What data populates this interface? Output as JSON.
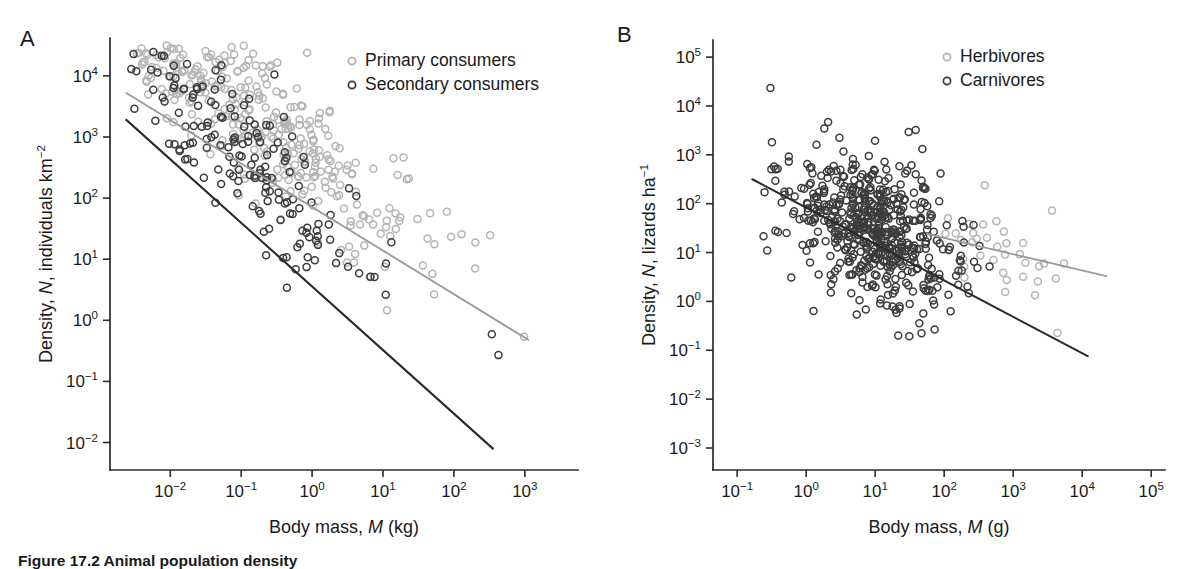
{
  "figure": {
    "caption": "Figure 17.2  Animal population density",
    "background_color": "#ffffff",
    "panels": [
      {
        "letter": "A",
        "legend": [
          {
            "label": "Primary consumers",
            "color": "#b4b4b4"
          },
          {
            "label": "Secondary consumers",
            "color": "#3c3c3c"
          }
        ]
      },
      {
        "letter": "B",
        "legend": [
          {
            "label": "Herbivores",
            "color": "#b4b4b4"
          },
          {
            "label": "Carnivores",
            "color": "#3c3c3c"
          }
        ]
      }
    ]
  },
  "chart_data": [
    {
      "id": "panel-a",
      "type": "scatter",
      "title": "",
      "panel_letter": "A",
      "xlabel": "Body mass, M (kg)",
      "xlabel_parts": {
        "pre": "Body mass, ",
        "italic": "M",
        "post": " (kg)"
      },
      "ylabel": "Density, N, individuals km−2",
      "ylabel_parts": {
        "pre": "Density, ",
        "italic": "N",
        "post": ", individuals km",
        "sup": "−2"
      },
      "xscale": "log",
      "yscale": "log",
      "xlim": [
        -2.85,
        3.75
      ],
      "ylim": [
        -2.45,
        4.62
      ],
      "xticks": [
        -2,
        -1,
        0,
        1,
        2,
        3
      ],
      "xtick_labels": [
        "10⁻²",
        "10⁻¹",
        "10⁰",
        "10¹",
        "10²",
        "10³"
      ],
      "xtick_exponents": [
        -2,
        -1,
        0,
        1,
        2,
        3
      ],
      "yticks": [
        -2,
        -1,
        0,
        1,
        2,
        3,
        4
      ],
      "ytick_labels": [
        "10⁻²",
        "10⁻¹",
        "10⁰",
        "10¹",
        "10²",
        "10³",
        "10⁴"
      ],
      "ytick_exponents": [
        -2,
        -1,
        0,
        1,
        2,
        3,
        4
      ],
      "grid": false,
      "legend_position": "top-right",
      "marker": "open-circle",
      "series": [
        {
          "name": "Primary consumers",
          "color": "#b4b4b4",
          "n_points": 330,
          "x_range": [
            -2.5,
            3.55
          ],
          "x_mode": -0.75,
          "x_spread": 1.05,
          "intercept": 2.72,
          "slope": -0.78,
          "scatter_sd": 0.62,
          "seed": 1733,
          "fit_line": {
            "x1": -2.62,
            "y1": 3.72,
            "x2": 3.05,
            "y2": -0.32,
            "color": "#9a9a9a",
            "width": 1.8
          }
        },
        {
          "name": "Secondary consumers",
          "color": "#3c3c3c",
          "n_points": 168,
          "x_range": [
            -2.6,
            2.65
          ],
          "x_mode": -1.05,
          "x_spread": 0.95,
          "intercept": 1.62,
          "slope": -1.02,
          "scatter_sd": 0.56,
          "seed": 907,
          "fit_line": {
            "x1": -2.62,
            "y1": 3.28,
            "x2": 2.55,
            "y2": -2.1,
            "color": "#2b2b2b",
            "width": 2.1
          }
        }
      ]
    },
    {
      "id": "panel-b",
      "type": "scatter",
      "title": "",
      "panel_letter": "B",
      "xlabel": "Body mass, M (g)",
      "xlabel_parts": {
        "pre": "Body mass, ",
        "italic": "M",
        "post": " (g)"
      },
      "ylabel": "Density, N, lizards ha−1",
      "ylabel_parts": {
        "pre": "Density, ",
        "italic": "N",
        "post": ", lizards ha",
        "sup": "−1"
      },
      "xscale": "log",
      "yscale": "log",
      "xlim": [
        -1.35,
        5.2
      ],
      "ylim": [
        -3.45,
        5.35
      ],
      "xticks": [
        -1,
        0,
        1,
        2,
        3,
        4,
        5
      ],
      "xtick_labels": [
        "10⁻¹",
        "10⁰",
        "10¹",
        "10²",
        "10³",
        "10⁴",
        "10⁵"
      ],
      "xtick_exponents": [
        -1,
        0,
        1,
        2,
        3,
        4,
        5
      ],
      "yticks": [
        -3,
        -2,
        -1,
        0,
        1,
        2,
        3,
        4,
        5
      ],
      "ytick_labels": [
        "10⁻³",
        "10⁻²",
        "10⁻¹",
        "10⁰",
        "10¹",
        "10²",
        "10³",
        "10⁴",
        "10⁵"
      ],
      "ytick_exponents": [
        -3,
        -2,
        -1,
        0,
        1,
        2,
        3,
        4,
        5
      ],
      "grid": false,
      "legend_position": "top-right",
      "marker": "open-circle",
      "series": [
        {
          "name": "Herbivores",
          "color": "#b4b4b4",
          "n_points": 38,
          "x_range": [
            1.6,
            4.3
          ],
          "x_mode": 2.7,
          "x_spread": 0.75,
          "intercept": 2.12,
          "slope": -0.42,
          "scatter_sd": 0.48,
          "seed": 5521,
          "fit_line": {
            "x1": 1.75,
            "y1": 1.38,
            "x2": 4.35,
            "y2": 0.52,
            "color": "#9a9a9a",
            "width": 1.8
          }
        },
        {
          "name": "Carnivores",
          "color": "#3c3c3c",
          "n_points": 560,
          "x_range": [
            -0.72,
            4.15
          ],
          "x_mode": 0.95,
          "x_spread": 0.62,
          "intercept": 1.98,
          "slope": -0.52,
          "scatter_sd": 0.72,
          "seed": 3109,
          "fit_line": {
            "x1": -0.78,
            "y1": 2.5,
            "x2": 4.08,
            "y2": -1.12,
            "color": "#2b2b2b",
            "width": 2.1
          }
        }
      ]
    }
  ]
}
